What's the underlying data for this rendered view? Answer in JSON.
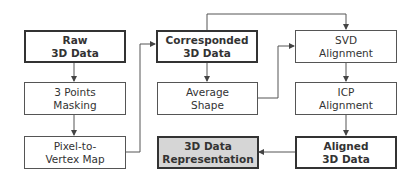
{
  "diagram": {
    "type": "flowchart",
    "nodes": [
      {
        "id": "raw",
        "label": "Raw\n3D Data",
        "emphasis": "bold"
      },
      {
        "id": "mask",
        "label": "3 Points\nMasking",
        "emphasis": "normal"
      },
      {
        "id": "p2v",
        "label": "Pixel-to-\nVertex Map",
        "emphasis": "normal"
      },
      {
        "id": "corr",
        "label": "Corresponded\n3D Data",
        "emphasis": "bold"
      },
      {
        "id": "avg",
        "label": "Average\nShape",
        "emphasis": "normal"
      },
      {
        "id": "repr",
        "label": "3D Data\nRepresentation",
        "emphasis": "bold",
        "fill": "#d6d6d6"
      },
      {
        "id": "svd",
        "label": "SVD\nAlignment",
        "emphasis": "normal"
      },
      {
        "id": "icp",
        "label": "ICP\nAlignment",
        "emphasis": "normal"
      },
      {
        "id": "aligned",
        "label": "Aligned\n3D Data",
        "emphasis": "bold"
      }
    ],
    "edges": [
      {
        "from": "raw",
        "to": "mask"
      },
      {
        "from": "mask",
        "to": "p2v"
      },
      {
        "from": "p2v",
        "to": "corr"
      },
      {
        "from": "corr",
        "to": "avg"
      },
      {
        "from": "corr",
        "to": "svd"
      },
      {
        "from": "avg",
        "to": "svd"
      },
      {
        "from": "svd",
        "to": "icp"
      },
      {
        "from": "icp",
        "to": "aligned"
      },
      {
        "from": "aligned",
        "to": "repr"
      }
    ],
    "colors": {
      "line": "#444444",
      "highlight_fill": "#d6d6d6"
    }
  }
}
